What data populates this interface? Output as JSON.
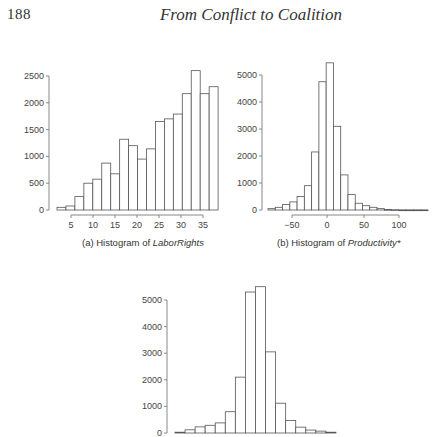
{
  "header": {
    "page_number": "188",
    "running_title": "From Conflict to Coalition"
  },
  "captions": {
    "a_prefix": "(a) Histogram of ",
    "a_var": "LaborRights",
    "b_prefix": "(b) Histogram of ",
    "b_var": "Productivity*"
  },
  "chart_data": [
    {
      "id": "a",
      "type": "bar",
      "title": "(a) Histogram of LaborRights",
      "xlabel": "LaborRights",
      "ylabel": "Frequency",
      "x_ticks": [
        5,
        10,
        15,
        20,
        25,
        30,
        35
      ],
      "y_ticks": [
        0,
        500,
        1000,
        1500,
        2000,
        2500
      ],
      "ylim": [
        0,
        2600
      ],
      "bin_start": 2,
      "bin_width": 2,
      "values": [
        50,
        75,
        250,
        500,
        575,
        875,
        675,
        1320,
        1200,
        950,
        1140,
        1650,
        1700,
        1790,
        2170,
        2600,
        2170,
        2300
      ],
      "grid": false
    },
    {
      "id": "b",
      "type": "bar",
      "title": "(b) Histogram of Productivity*",
      "xlabel": "Productivity*",
      "ylabel": "Frequency",
      "x_ticks": [
        -50,
        0,
        50,
        100
      ],
      "y_ticks": [
        0,
        1000,
        2000,
        3000,
        4000,
        5000
      ],
      "ylim": [
        0,
        5500
      ],
      "bin_start": -80,
      "bin_width": 10,
      "values": [
        50,
        100,
        200,
        300,
        500,
        900,
        2150,
        4750,
        5450,
        3100,
        1300,
        570,
        250,
        160,
        100,
        50,
        20,
        10,
        5,
        5,
        5,
        5
      ],
      "grid": false
    },
    {
      "id": "c",
      "type": "bar",
      "title": "",
      "xlabel": "",
      "ylabel": "Frequency",
      "x_ticks": [],
      "y_ticks": [
        0,
        1000,
        2000,
        3000,
        4000,
        5000
      ],
      "ylim": [
        0,
        5600
      ],
      "values": [
        30,
        120,
        230,
        290,
        380,
        800,
        2100,
        5300,
        5500,
        3050,
        1120,
        470,
        220,
        110,
        70,
        30
      ],
      "grid": false
    }
  ],
  "layout": {
    "a": {
      "axis_x": 49,
      "y0": 210,
      "y_top_val": 2500,
      "y_top_px": 76,
      "bar_x0": 57,
      "bar_w": 8.95,
      "xaxis_y": 215,
      "x_tick_px": {
        "5": 71,
        "10": 93,
        "15": 115,
        "20": 137,
        "25": 159,
        "30": 181,
        "35": 203
      }
    },
    "b": {
      "axis_x": 262,
      "y0": 210,
      "y_top_val": 5000,
      "y_top_px": 75,
      "bar_x0": 268,
      "bar_w": 7.27,
      "xaxis_y": 215,
      "x_tick_px": {
        "-50": 292,
        "0": 327,
        "50": 364,
        "100": 399
      }
    },
    "c": {
      "axis_x": 167,
      "y0": 433,
      "y_top_val": 5000,
      "y_top_px": 300,
      "bar_x0": 175,
      "bar_w": 10.06
    }
  }
}
